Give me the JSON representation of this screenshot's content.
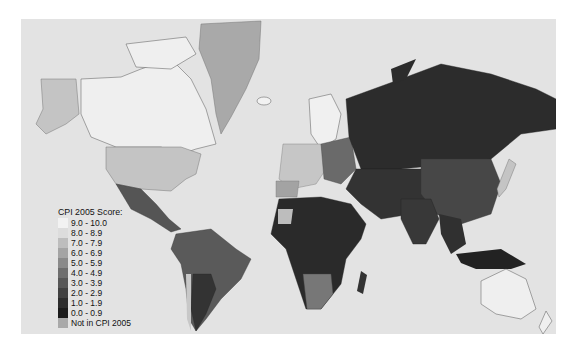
{
  "map": {
    "title": "CPI 2005 Score:",
    "background_color": "#e3e3e3",
    "legend": [
      {
        "label": "9.0 - 10.0",
        "color": "#f2f2f2"
      },
      {
        "label": "8.0 - 8.9",
        "color": "#dcdcdc"
      },
      {
        "label": "7.0 - 7.9",
        "color": "#bdbdbd"
      },
      {
        "label": "6.0 - 6.9",
        "color": "#a4a4a4"
      },
      {
        "label": "5.0 - 5.9",
        "color": "#8a8a8a"
      },
      {
        "label": "4.0 - 4.9",
        "color": "#6e6e6e"
      },
      {
        "label": "3.0 - 3.9",
        "color": "#575757"
      },
      {
        "label": "2.0 - 2.9",
        "color": "#414141"
      },
      {
        "label": "1.0 - 1.9",
        "color": "#2d2d2d"
      },
      {
        "label": "0.0 - 0.9",
        "color": "#1b1b1b"
      },
      {
        "label": "Not in CPI 2005",
        "color": "#a9a9a9"
      }
    ]
  }
}
